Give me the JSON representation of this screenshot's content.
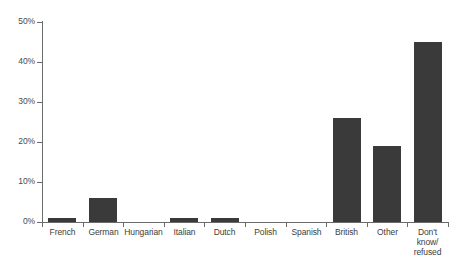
{
  "chart_data": {
    "type": "bar",
    "title": "",
    "subtitle": "",
    "xlabel": "",
    "ylabel": "",
    "categories": [
      "French",
      "German",
      "Hungarian",
      "Italian",
      "Dutch",
      "Polish",
      "Spanish",
      "British",
      "Other",
      "Don't know/ refused"
    ],
    "category_lines": [
      [
        "French"
      ],
      [
        "German"
      ],
      [
        "Hungarian"
      ],
      [
        "Italian"
      ],
      [
        "Dutch"
      ],
      [
        "Polish"
      ],
      [
        "Spanish"
      ],
      [
        "British"
      ],
      [
        "Other"
      ],
      [
        "Don't",
        "know/",
        "refused"
      ]
    ],
    "values": [
      1,
      6,
      0,
      1,
      1,
      0,
      0,
      26,
      19,
      45
    ],
    "ylim": [
      0,
      50
    ],
    "ytick_values": [
      0,
      10,
      20,
      30,
      40,
      50
    ],
    "ytick_labels": [
      "0%",
      "10%",
      "20%",
      "30%",
      "40%",
      "50%"
    ],
    "grid": false,
    "legend": null,
    "legend_position": "none",
    "bar_color": "#3a3a3a",
    "axis_color": "#6b6b6b",
    "background_color": "#ffffff"
  }
}
